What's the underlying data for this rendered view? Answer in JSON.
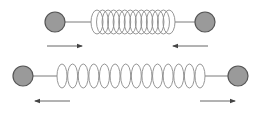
{
  "diagram": {
    "colors": {
      "ball_fill": "#9a9a9a",
      "ball_stroke": "#555555",
      "coil_stroke": "#8a8a8a",
      "rod_stroke": "#7a7a7a",
      "arrow_stroke": "#555555"
    },
    "systems": [
      {
        "id": "compressed",
        "state": "compressed",
        "center_y": 22,
        "left_ball": {
          "cx": 55,
          "cy": 22,
          "r": 10
        },
        "right_ball": {
          "cx": 205,
          "cy": 22,
          "r": 10
        },
        "coil": {
          "x_start": 91,
          "x_end": 175,
          "count": 14,
          "ry": 12,
          "rx": 6
        },
        "arrows": [
          {
            "x1": 47,
            "x2": 82,
            "y": 46,
            "direction": "right"
          },
          {
            "x1": 208,
            "x2": 173,
            "y": 46,
            "direction": "left"
          }
        ]
      },
      {
        "id": "stretched",
        "state": "stretched",
        "center_y": 76,
        "left_ball": {
          "cx": 23,
          "cy": 76,
          "r": 10
        },
        "right_ball": {
          "cx": 238,
          "cy": 76,
          "r": 10
        },
        "coil": {
          "x_start": 57,
          "x_end": 205,
          "count": 14,
          "ry": 12,
          "rx": 5
        },
        "arrows": [
          {
            "x1": 70,
            "x2": 35,
            "y": 101,
            "direction": "left"
          },
          {
            "x1": 200,
            "x2": 235,
            "y": 101,
            "direction": "right"
          }
        ]
      }
    ]
  }
}
